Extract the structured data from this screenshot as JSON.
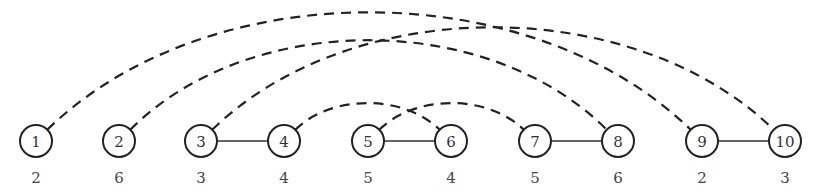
{
  "diagram": {
    "type": "graph",
    "node_y": 141,
    "weight_y": 178,
    "radius": 16,
    "nodes": [
      {
        "id": "1",
        "label": "1",
        "x": 36,
        "weight": "2"
      },
      {
        "id": "2",
        "label": "2",
        "x": 119,
        "weight": "6"
      },
      {
        "id": "3",
        "label": "3",
        "x": 201,
        "weight": "3"
      },
      {
        "id": "4",
        "label": "4",
        "x": 284,
        "weight": "4"
      },
      {
        "id": "5",
        "label": "5",
        "x": 368,
        "weight": "5"
      },
      {
        "id": "6",
        "label": "6",
        "x": 451,
        "weight": "4"
      },
      {
        "id": "7",
        "label": "7",
        "x": 535,
        "weight": "5"
      },
      {
        "id": "8",
        "label": "8",
        "x": 618,
        "weight": "6"
      },
      {
        "id": "9",
        "label": "9",
        "x": 702,
        "weight": "2"
      },
      {
        "id": "10",
        "label": "10",
        "x": 785,
        "weight": "3"
      }
    ],
    "solid_edges": [
      {
        "from": "3",
        "to": "4"
      },
      {
        "from": "5",
        "to": "6"
      },
      {
        "from": "7",
        "to": "8"
      },
      {
        "from": "9",
        "to": "10"
      }
    ],
    "dashed_edges": [
      {
        "from": "4",
        "to": "6",
        "peak_y": 103
      },
      {
        "from": "5",
        "to": "7",
        "peak_y": 103
      },
      {
        "from": "2",
        "to": "8",
        "peak_y": 40
      },
      {
        "from": "3",
        "to": "10",
        "peak_y": 27
      },
      {
        "from": "1",
        "to": "9",
        "peak_y": 12
      }
    ],
    "colors": {
      "stroke": "#222222",
      "background": "#ffffff"
    }
  }
}
